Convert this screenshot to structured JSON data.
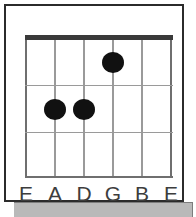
{
  "diagram": {
    "type": "guitar-chord-diagram",
    "frets_shown": 3,
    "strings": [
      {
        "index": 0,
        "label": "E",
        "x": 0
      },
      {
        "index": 1,
        "label": "A",
        "x": 29
      },
      {
        "index": 2,
        "label": "D",
        "x": 58
      },
      {
        "index": 3,
        "label": "G",
        "x": 87
      },
      {
        "index": 4,
        "label": "B",
        "x": 116
      },
      {
        "index": 5,
        "label": "E",
        "x": 145
      }
    ],
    "fret_lines": [
      {
        "index": 1,
        "y": 50
      },
      {
        "index": 2,
        "y": 97
      },
      {
        "index": 3,
        "y": 141
      }
    ],
    "nut": {
      "y": 0,
      "thickness": 5,
      "color": "#3a3a3a"
    },
    "dots": [
      {
        "string": 3,
        "string_label": "G",
        "fret": 1,
        "x": 87,
        "y": 17
      },
      {
        "string": 1,
        "string_label": "A",
        "fret": 2,
        "x": 29,
        "y": 64
      },
      {
        "string": 2,
        "string_label": "D",
        "fret": 2,
        "x": 58,
        "y": 64
      }
    ]
  },
  "colors": {
    "frame": "#2b2b2b",
    "grid": "#9a9a9a",
    "grid_edge": "#6f6f6f",
    "dot": "#111111",
    "label_text": "#3d3d3d",
    "bottom_bar": "#b9b9b9",
    "background": "#ffffff"
  }
}
